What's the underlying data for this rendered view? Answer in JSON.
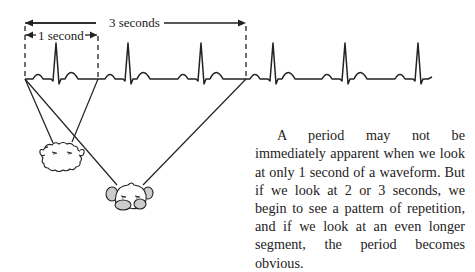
{
  "diagram": {
    "labels": {
      "three_seconds": "3 seconds",
      "one_second": "1 second"
    },
    "waveform": {
      "type": "ecg",
      "baseline_y": 79,
      "beat_r_peaks_x": [
        56,
        128,
        201,
        273,
        345,
        418
      ],
      "start_x": 25,
      "end_x": 432
    },
    "windows": [
      {
        "name": "1 second",
        "x_start": 25,
        "x_end": 98
      },
      {
        "name": "3 seconds",
        "x_start": 25,
        "x_end": 246
      }
    ],
    "observers": [
      {
        "name": "small-eyed-creature-1s",
        "x": 62,
        "y": 152
      },
      {
        "name": "creature-3s",
        "x": 128,
        "y": 201
      }
    ]
  },
  "caption": {
    "text": "A period may not be immediately apparent when we look at only 1 second of a waveform. But if we look at 2 or 3 seconds, we begin to see a pattern of repetition, and if we look at an even longer segment, the period becomes obvious."
  }
}
